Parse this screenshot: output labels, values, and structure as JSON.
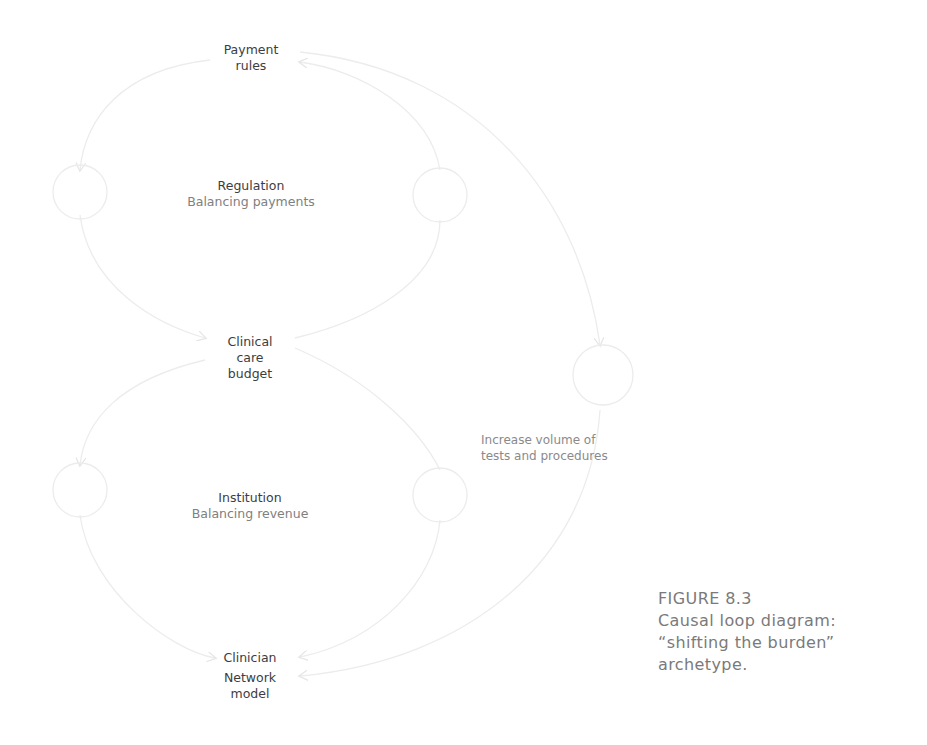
{
  "diagram": {
    "nodes": {
      "payment_rules": [
        "Payment",
        "rules"
      ],
      "clinical_care_budget": [
        "Clinical",
        "care",
        "budget"
      ],
      "clinician": "Clinician",
      "network_model": [
        "Network",
        "model"
      ]
    },
    "loops": {
      "regulation": {
        "title": "Regulation",
        "subtitle": "Balancing payments"
      },
      "institution": {
        "title": "Institution",
        "subtitle": "Balancing revenue"
      }
    },
    "side_effect_label": [
      "Increase volume of",
      "tests and procedures"
    ],
    "line_color": "#ececec",
    "text_color": "#3d3d3d"
  },
  "caption": {
    "figure_number": "FIGURE 8.3",
    "lines": [
      "Causal loop diagram:",
      "“shifting the burden”",
      "archetype."
    ]
  }
}
